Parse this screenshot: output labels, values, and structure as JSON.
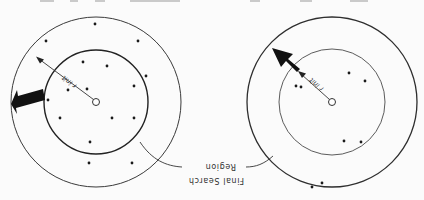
{
  "figure": {
    "orientation": "rotated-180",
    "label": {
      "line1": "Final Search",
      "line2": "Region"
    },
    "radius_label": "r init",
    "colors": {
      "stroke": "#3a3a3a",
      "fill_arrow": "#111111",
      "dot": "#1a1a1a",
      "background": "#fbfbfb"
    },
    "panels": [
      {
        "id": "left",
        "center": [
          96,
          102
        ],
        "outer_radius": 85,
        "inner_radius": 52,
        "dot_count": 17
      },
      {
        "id": "right",
        "center": [
          332,
          102
        ],
        "outer_radius": 85,
        "inner_radius": 53,
        "dot_count": 4
      }
    ]
  }
}
